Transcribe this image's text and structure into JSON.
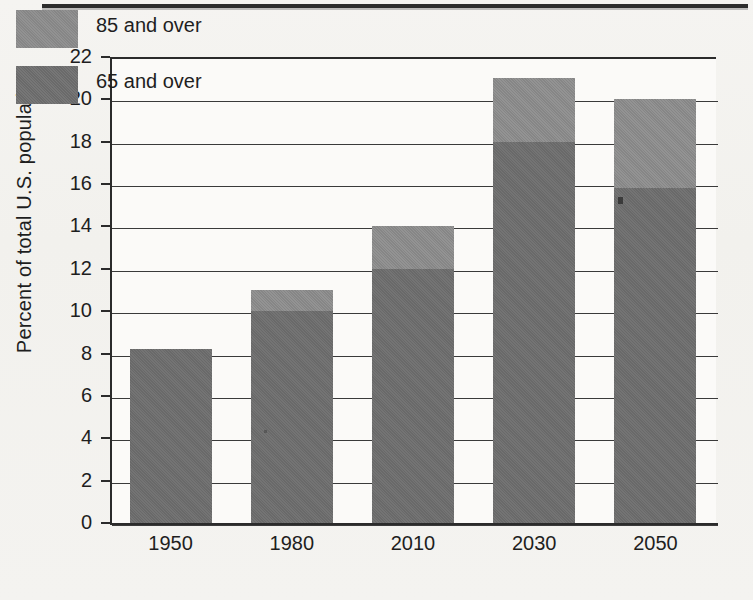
{
  "figure": {
    "top_rule": "horizontal-rule"
  },
  "chart_data": {
    "type": "bar",
    "subtype": "stacked-bar",
    "title": "",
    "xlabel": "",
    "ylabel": "Percent of total U.S. population",
    "categories": [
      "1950",
      "1980",
      "2010",
      "2030",
      "2050"
    ],
    "ylim": [
      0,
      22
    ],
    "ytick_labels": [
      "0",
      "2",
      "4",
      "6",
      "8",
      "10",
      "12",
      "14",
      "16",
      "18",
      "20",
      "22"
    ],
    "ytick_values": [
      0,
      2,
      4,
      6,
      8,
      10,
      12,
      14,
      16,
      18,
      20,
      22
    ],
    "grid": true,
    "grid_axis": "y",
    "legend_position": "upper-left-inside",
    "series": [
      {
        "name": "65 and over",
        "color": "#6e6e6e",
        "values": [
          8.2,
          10.0,
          12.0,
          18.0,
          15.8
        ]
      },
      {
        "name": "85 and over",
        "color": "#8b8b8b",
        "values": [
          0.0,
          1.0,
          2.0,
          3.0,
          4.2
        ]
      }
    ],
    "totals": [
      8.2,
      11.0,
      14.0,
      21.0,
      20.0
    ]
  },
  "legend": {
    "items": [
      {
        "label": "85 and over",
        "color": "#8b8b8b"
      },
      {
        "label": "65 and over",
        "color": "#6e6e6e"
      }
    ]
  }
}
